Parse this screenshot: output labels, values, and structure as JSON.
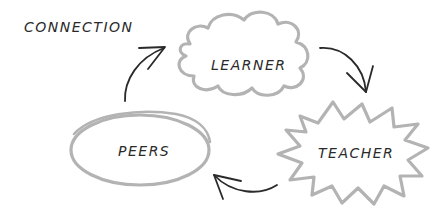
{
  "diagram": {
    "title": "CONNECTION",
    "nodes": [
      {
        "id": "learner",
        "label": "LEARNER",
        "shape": "cloud"
      },
      {
        "id": "teacher",
        "label": "TEACHER",
        "shape": "starburst"
      },
      {
        "id": "peers",
        "label": "PEERS",
        "shape": "ellipse"
      }
    ],
    "edges": [
      {
        "from": "peers",
        "to": "learner"
      },
      {
        "from": "learner",
        "to": "teacher"
      },
      {
        "from": "teacher",
        "to": "peers"
      }
    ],
    "colors": {
      "shape_stroke": "#b3b3b3",
      "arrow_stroke": "#2a2a2a",
      "text": "#2a2a2a",
      "background": "#ffffff"
    }
  }
}
